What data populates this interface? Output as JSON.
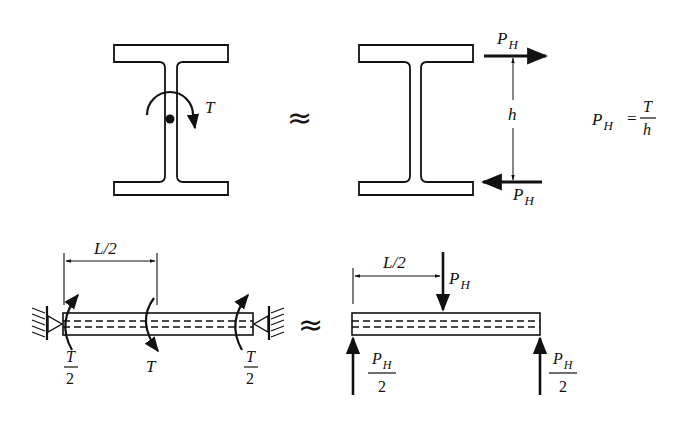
{
  "figure": {
    "top_left": {
      "torque_label": "T"
    },
    "approx_symbol": "≈",
    "top_middle": {
      "top_force_label": "P",
      "top_force_sub": "H",
      "bottom_force_label": "P",
      "bottom_force_sub": "H",
      "height_label": "h"
    },
    "equation": {
      "lhs": "P",
      "lhs_sub": "H",
      "equals": "=",
      "numerator": "T",
      "denominator": "h"
    },
    "bottom_left": {
      "span_label": "L/2",
      "left_torque_num": "T",
      "left_torque_den": "2",
      "mid_torque_label": "T",
      "right_torque_num": "T",
      "right_torque_den": "2"
    },
    "bottom_right": {
      "span_label": "L/2",
      "load_label": "P",
      "load_sub": "H",
      "left_reaction_num": "P",
      "left_reaction_num_sub": "H",
      "left_reaction_den": "2",
      "right_reaction_num": "P",
      "right_reaction_num_sub": "H",
      "right_reaction_den": "2"
    }
  }
}
